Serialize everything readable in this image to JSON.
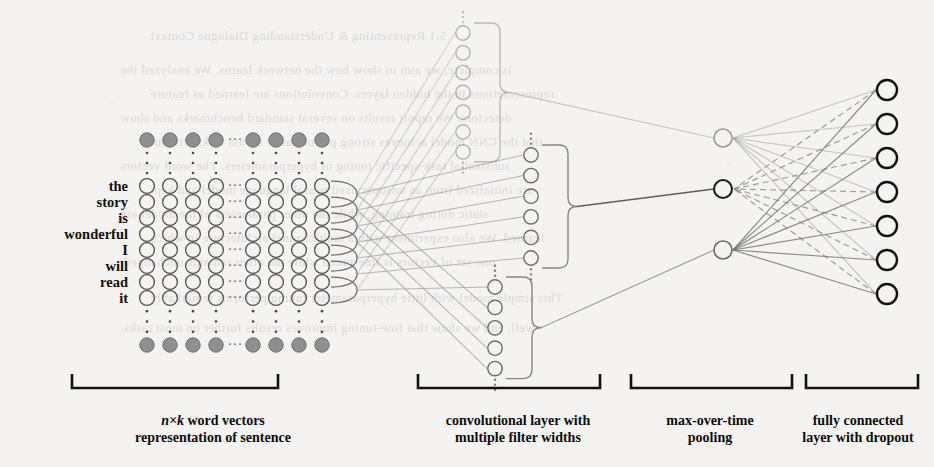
{
  "figure": {
    "background_color": "#f4f3f1",
    "ink_color": "#111111",
    "line_color": "#8a8a8a",
    "embedding_dot_color": "#8f8f8f"
  },
  "bleed_through_text": {
    "note": "faint mirrored text bleeding from reverse side of scanned page",
    "lines": [
      "5.1 Representing & Understanding Dialogue Context",
      "is complete, we aim to show how the network learns. We analyzed the",
      "representations in the hidden layers. Convolutions are learned as feature",
      "detectors. We report results on several standard benchmarks and show",
      "that the CNN model achieves strong performance across tasks without",
      "substantial task-specific tuning of hyperparameters. The word vectors",
      "are initialized from an unsupervised neural language model and kept",
      "static during training, while the other parameters of the model are",
      "learned. We also experiment with a multichannel architecture in which",
      "one set of vectors is fine-tuned while the other remains unchanged.",
      "This simple model with little hyperparameter tuning performs remarkably",
      "well, and we show that fine-tuning improves results further on most tasks."
    ]
  },
  "sentence_matrix": {
    "caption_line1": "n×k word vectors",
    "caption_line1_italic": "n×k",
    "caption_line1_rest": " word vectors",
    "caption_line2": "representation of sentence",
    "words": [
      "the",
      "story",
      "is",
      "wonderful",
      "I",
      "will",
      "read",
      "it"
    ],
    "visible_columns": 8,
    "ellipsis_glyph": "⋯",
    "vertical_ellipsis_glyph": "⋮",
    "row_y": [
      186,
      202,
      218,
      234,
      250,
      266,
      282,
      298
    ],
    "col_x": [
      147,
      170,
      193,
      216,
      253,
      276,
      299,
      322
    ],
    "ellipsis_col_x": 235,
    "top_dots_y": 140,
    "bottom_dots_y": 345,
    "label_right_x": 128
  },
  "convolutional_layer": {
    "caption_line1": "convolutional layer with",
    "caption_line2": "multiple filter widths",
    "filter_groups": [
      {
        "name": "filter-width-group-1",
        "x": 463,
        "count": 7,
        "y_start": 33,
        "y_step": 19.8,
        "tone": "light"
      },
      {
        "name": "filter-width-group-2",
        "x": 531,
        "count": 6,
        "y_start": 155,
        "y_step": 20.6,
        "tone": "mid"
      },
      {
        "name": "filter-width-group-3",
        "x": 495,
        "count": 5,
        "y_start": 287,
        "y_step": 20.4,
        "tone": "mid"
      }
    ]
  },
  "pooling_layer": {
    "caption_line1": "max-over-time",
    "caption_line2": "pooling",
    "nodes": [
      {
        "name": "pooling-node-1",
        "x": 723,
        "y": 138,
        "tone": "light"
      },
      {
        "name": "pooling-node-2",
        "x": 723,
        "y": 189,
        "tone": "dark",
        "dropout": true
      },
      {
        "name": "pooling-node-3",
        "x": 723,
        "y": 250,
        "tone": "mid"
      }
    ]
  },
  "output_layer": {
    "caption_line1": "fully connected",
    "caption_line2": "layer with dropout",
    "node_x": 887,
    "node_count": 7,
    "node_y": [
      90,
      124,
      158,
      192,
      226,
      260,
      294
    ],
    "dropout_line_style": "dashed"
  },
  "captions": [
    {
      "name": "caption-sentence-matrix",
      "center_x": 213,
      "bracket_left": 72,
      "bracket_right": 278
    },
    {
      "name": "caption-conv-layer",
      "center_x": 518,
      "bracket_left": 418,
      "bracket_right": 600
    },
    {
      "name": "caption-pooling",
      "center_x": 710,
      "bracket_left": 631,
      "bracket_right": 792
    },
    {
      "name": "caption-output",
      "center_x": 858,
      "bracket_left": 806,
      "bracket_right": 918
    },
    {
      "bracket_y": 388,
      "bracket_tick": 14,
      "text_y": 412
    }
  ]
}
